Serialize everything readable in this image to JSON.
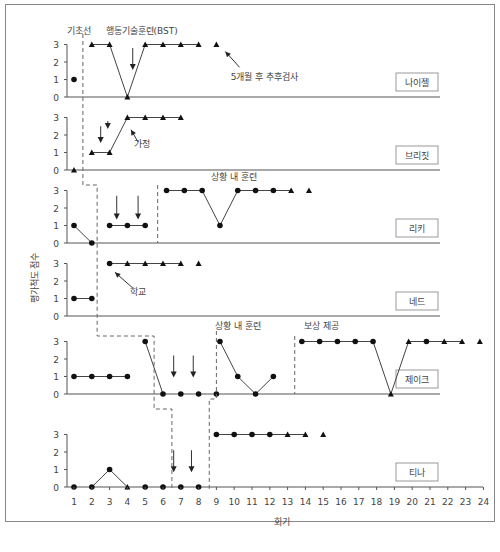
{
  "chart_data": {
    "type": "line",
    "title": "",
    "xlabel": "회기",
    "ylabel": "평가척도 점수",
    "xlim": [
      1,
      24
    ],
    "ylim": [
      0,
      3
    ],
    "x_ticks": [
      1,
      2,
      3,
      4,
      5,
      6,
      7,
      8,
      9,
      10,
      11,
      12,
      13,
      14,
      15,
      16,
      17,
      18,
      19,
      20,
      21,
      22,
      23,
      24
    ],
    "y_ticks": [
      0,
      1,
      2,
      3
    ],
    "legend": {
      "circle": "session data (circle marker)",
      "triangle": "session data (triangle marker)"
    },
    "panels": [
      {
        "name": "나이젤",
        "baseline_y": 97,
        "points": [
          {
            "x": 1,
            "y": 1,
            "m": "c",
            "c": false
          },
          {
            "x": 2,
            "y": 3,
            "m": "t",
            "c": false
          },
          {
            "x": 3,
            "y": 3,
            "m": "t",
            "c": true
          },
          {
            "x": 4,
            "y": 0,
            "m": "t",
            "c": true
          },
          {
            "x": 5,
            "y": 3,
            "m": "t",
            "c": true
          },
          {
            "x": 6,
            "y": 3,
            "m": "t",
            "c": true
          },
          {
            "x": 7,
            "y": 3,
            "m": "t",
            "c": true
          },
          {
            "x": 8,
            "y": 3,
            "m": "t",
            "c": true
          },
          {
            "x": 9,
            "y": 3,
            "m": "t",
            "c": false
          }
        ],
        "annotations": [
          {
            "text": "기초선",
            "x": 1.3,
            "y": 3.6
          },
          {
            "text": "행동기술훈련(BST)",
            "x": 4.8,
            "y": 3.6
          },
          {
            "text": "5개월 후 추후검사",
            "x": 11.7,
            "y": 1.0
          }
        ],
        "arrows": [
          {
            "x": 4.3,
            "top": 2.8,
            "bottom": 1.6
          }
        ],
        "pointer": {
          "x1": 10.3,
          "y1": 1.7,
          "x2": 9.5,
          "y2": 2.6
        }
      },
      {
        "name": "브리짓",
        "baseline_y": 170,
        "points": [
          {
            "x": 1,
            "y": 0,
            "m": "t",
            "c": false
          },
          {
            "x": 2,
            "y": 1,
            "m": "t",
            "c": false
          },
          {
            "x": 3,
            "y": 1,
            "m": "t",
            "c": true
          },
          {
            "x": 4,
            "y": 3,
            "m": "t",
            "c": true
          },
          {
            "x": 5,
            "y": 3,
            "m": "t",
            "c": true
          },
          {
            "x": 6,
            "y": 3,
            "m": "t",
            "c": true
          },
          {
            "x": 7,
            "y": 3,
            "m": "t",
            "c": true
          }
        ],
        "annotations": [
          {
            "text": "가정",
            "x": 4.8,
            "y": 1.3
          }
        ],
        "arrows": [
          {
            "x": 2.5,
            "top": 2.5,
            "bottom": 1.6
          },
          {
            "x": 2.9,
            "top": 2.8,
            "bottom": 2.4
          }
        ],
        "pointer": {
          "x1": 4.6,
          "y1": 1.6,
          "x2": 4.2,
          "y2": 2.3
        }
      },
      {
        "name": "리키",
        "baseline_y": 243,
        "points": [
          {
            "x": 1,
            "y": 1,
            "m": "c",
            "c": false
          },
          {
            "x": 2,
            "y": 0,
            "m": "c",
            "c": true
          },
          {
            "x": 3,
            "y": 1,
            "m": "c",
            "c": false
          },
          {
            "x": 4,
            "y": 1,
            "m": "c",
            "c": true
          },
          {
            "x": 5,
            "y": 1,
            "m": "c",
            "c": true
          },
          {
            "x": 6.2,
            "y": 3,
            "m": "c",
            "c": false
          },
          {
            "x": 7.2,
            "y": 3,
            "m": "c",
            "c": true
          },
          {
            "x": 8.2,
            "y": 3,
            "m": "c",
            "c": true
          },
          {
            "x": 9.2,
            "y": 1,
            "m": "c",
            "c": true
          },
          {
            "x": 10.2,
            "y": 3,
            "m": "c",
            "c": true
          },
          {
            "x": 11.2,
            "y": 3,
            "m": "c",
            "c": true
          },
          {
            "x": 12.2,
            "y": 3,
            "m": "c",
            "c": true
          },
          {
            "x": 13.2,
            "y": 3,
            "m": "t",
            "c": true
          },
          {
            "x": 14.2,
            "y": 3,
            "m": "t",
            "c": false
          }
        ],
        "annotations": [
          {
            "text": "상황 내 훈련",
            "x": 10.0,
            "y": 3.6
          }
        ],
        "arrows": [
          {
            "x": 3.4,
            "top": 2.7,
            "bottom": 1.4
          },
          {
            "x": 4.6,
            "top": 2.7,
            "bottom": 1.4
          }
        ]
      },
      {
        "name": "네드",
        "baseline_y": 316,
        "points": [
          {
            "x": 1,
            "y": 1,
            "m": "c",
            "c": false
          },
          {
            "x": 2,
            "y": 1,
            "m": "c",
            "c": true
          },
          {
            "x": 3,
            "y": 3,
            "m": "c",
            "c": false
          },
          {
            "x": 4,
            "y": 3,
            "m": "t",
            "c": true
          },
          {
            "x": 5,
            "y": 3,
            "m": "t",
            "c": true
          },
          {
            "x": 6,
            "y": 3,
            "m": "t",
            "c": true
          },
          {
            "x": 7,
            "y": 3,
            "m": "t",
            "c": true
          },
          {
            "x": 8,
            "y": 3,
            "m": "t",
            "c": false
          }
        ],
        "annotations": [
          {
            "text": "학교",
            "x": 4.6,
            "y": 1.2
          }
        ],
        "pointer": {
          "x1": 4.3,
          "y1": 1.6,
          "x2": 3.3,
          "y2": 2.5
        }
      },
      {
        "name": "제이크",
        "baseline_y": 394,
        "points": [
          {
            "x": 1,
            "y": 1,
            "m": "c",
            "c": false
          },
          {
            "x": 2,
            "y": 1,
            "m": "c",
            "c": true
          },
          {
            "x": 3,
            "y": 1,
            "m": "c",
            "c": true
          },
          {
            "x": 4,
            "y": 1,
            "m": "c",
            "c": true
          },
          {
            "x": 5,
            "y": 3,
            "m": "c",
            "c": false
          },
          {
            "x": 6,
            "y": 0,
            "m": "c",
            "c": true
          },
          {
            "x": 7,
            "y": 0,
            "m": "c",
            "c": false
          },
          {
            "x": 8,
            "y": 0,
            "m": "c",
            "c": false
          },
          {
            "x": 9,
            "y": 0,
            "m": "c",
            "c": false
          },
          {
            "x": 9.2,
            "y": 3,
            "m": "c",
            "c": false
          },
          {
            "x": 10.2,
            "y": 1,
            "m": "c",
            "c": true
          },
          {
            "x": 11.2,
            "y": 0,
            "m": "c",
            "c": true
          },
          {
            "x": 12.2,
            "y": 1,
            "m": "c",
            "c": true
          },
          {
            "x": 13.8,
            "y": 3,
            "m": "c",
            "c": false
          },
          {
            "x": 14.8,
            "y": 3,
            "m": "c",
            "c": true
          },
          {
            "x": 15.8,
            "y": 3,
            "m": "c",
            "c": true
          },
          {
            "x": 16.8,
            "y": 3,
            "m": "c",
            "c": true
          },
          {
            "x": 17.8,
            "y": 3,
            "m": "c",
            "c": true
          },
          {
            "x": 18.8,
            "y": 0,
            "m": "t",
            "c": true
          },
          {
            "x": 19.8,
            "y": 3,
            "m": "t",
            "c": true
          },
          {
            "x": 20.8,
            "y": 3,
            "m": "c",
            "c": true
          },
          {
            "x": 21.8,
            "y": 3,
            "m": "t",
            "c": true
          },
          {
            "x": 22.8,
            "y": 3,
            "m": "t",
            "c": true
          },
          {
            "x": 23.8,
            "y": 3,
            "m": "t",
            "c": false
          }
        ],
        "annotations": [
          {
            "text": "상황 내 훈련",
            "x": 10.2,
            "y": 3.7
          },
          {
            "text": "보상 제공",
            "x": 14.9,
            "y": 3.7
          }
        ],
        "arrows": [
          {
            "x": 6.6,
            "top": 2.2,
            "bottom": 1.0
          },
          {
            "x": 7.7,
            "top": 2.2,
            "bottom": 1.0
          }
        ]
      },
      {
        "name": "티나",
        "baseline_y": 487,
        "points": [
          {
            "x": 1,
            "y": 0,
            "m": "c",
            "c": false
          },
          {
            "x": 2,
            "y": 0,
            "m": "c",
            "c": false
          },
          {
            "x": 3,
            "y": 1,
            "m": "c",
            "c": true
          },
          {
            "x": 4,
            "y": 0,
            "m": "t",
            "c": true
          },
          {
            "x": 5,
            "y": 0,
            "m": "c",
            "c": false
          },
          {
            "x": 6,
            "y": 0,
            "m": "c",
            "c": false
          },
          {
            "x": 7,
            "y": 0,
            "m": "c",
            "c": false
          },
          {
            "x": 8,
            "y": 0,
            "m": "c",
            "c": false
          },
          {
            "x": 9,
            "y": 3,
            "m": "c",
            "c": false
          },
          {
            "x": 10,
            "y": 3,
            "m": "c",
            "c": true
          },
          {
            "x": 11,
            "y": 3,
            "m": "c",
            "c": true
          },
          {
            "x": 12,
            "y": 3,
            "m": "c",
            "c": true
          },
          {
            "x": 13,
            "y": 3,
            "m": "t",
            "c": true
          },
          {
            "x": 14,
            "y": 3,
            "m": "t",
            "c": true
          },
          {
            "x": 15,
            "y": 3,
            "m": "t",
            "c": false
          }
        ],
        "annotations": [],
        "arrows": [
          {
            "x": 6.6,
            "top": 2.1,
            "bottom": 0.9
          },
          {
            "x": 7.6,
            "top": 2.1,
            "bottom": 0.9
          }
        ]
      }
    ],
    "phase_lines": "dashed stepped lines separating baseline from intervention phases across panels"
  }
}
